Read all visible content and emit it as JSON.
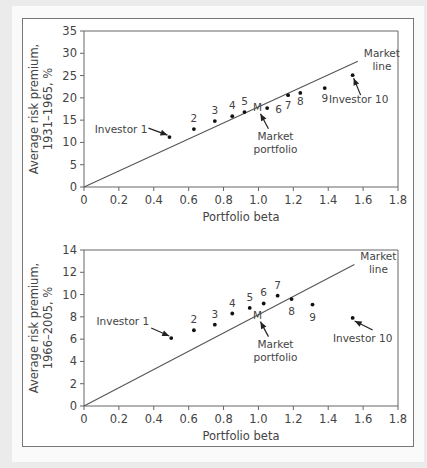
{
  "chart_data": [
    {
      "type": "scatter",
      "title": "",
      "xlabel": "Portfolio beta",
      "ylabel_lines": [
        "Average risk premium,",
        "1931–1965, %"
      ],
      "xlim": [
        0,
        1.8
      ],
      "ylim": [
        0,
        35
      ],
      "xticks": [
        0,
        0.2,
        0.4,
        0.6,
        0.8,
        1.0,
        1.2,
        1.4,
        1.6,
        1.8
      ],
      "xtick_labels": [
        "0",
        "0.2",
        "0.4",
        "0.6",
        "0.8",
        "1.0",
        "1.2",
        "1.4",
        "1.6",
        "1.8"
      ],
      "yticks": [
        0,
        5,
        10,
        15,
        20,
        25,
        30,
        35
      ],
      "ytick_labels": [
        "0",
        "5",
        "10",
        "15",
        "20",
        "25",
        "30",
        "35"
      ],
      "grid": false,
      "market_line": {
        "label_lines": [
          "Market",
          "line"
        ],
        "x": [
          0,
          1.57
        ],
        "y": [
          0,
          28.2
        ]
      },
      "market_portfolio": {
        "label": "M",
        "annotation_lines": [
          "Market",
          "portfolio"
        ],
        "x": 1.0,
        "y": 18.0
      },
      "points": [
        {
          "label": "Investor 1",
          "x": 0.49,
          "y": 11.2
        },
        {
          "label": "2",
          "x": 0.63,
          "y": 13.0
        },
        {
          "label": "3",
          "x": 0.75,
          "y": 14.8
        },
        {
          "label": "4",
          "x": 0.85,
          "y": 15.9
        },
        {
          "label": "5",
          "x": 0.92,
          "y": 16.8
        },
        {
          "label": "6",
          "x": 1.05,
          "y": 17.7
        },
        {
          "label": "7",
          "x": 1.17,
          "y": 20.6
        },
        {
          "label": "8",
          "x": 1.24,
          "y": 21.1
        },
        {
          "label": "9",
          "x": 1.38,
          "y": 22.2
        },
        {
          "label": "Investor 10",
          "x": 1.54,
          "y": 25.1
        }
      ]
    },
    {
      "type": "scatter",
      "title": "",
      "xlabel": "Portfolio beta",
      "ylabel_lines": [
        "Average risk premium,",
        "1966–2005, %"
      ],
      "xlim": [
        0,
        1.8
      ],
      "ylim": [
        0,
        14
      ],
      "xticks": [
        0,
        0.2,
        0.4,
        0.6,
        0.8,
        1.0,
        1.2,
        1.4,
        1.6,
        1.8
      ],
      "xtick_labels": [
        "0",
        "0.2",
        "0.4",
        "0.6",
        "0.8",
        "1.0",
        "1.2",
        "1.4",
        "1.6",
        "1.8"
      ],
      "yticks": [
        0,
        2,
        4,
        6,
        8,
        10,
        12,
        14
      ],
      "ytick_labels": [
        "0",
        "2",
        "4",
        "6",
        "8",
        "10",
        "12",
        "14"
      ],
      "grid": false,
      "market_line": {
        "label_lines": [
          "Market",
          "line"
        ],
        "x": [
          0,
          1.55
        ],
        "y": [
          0,
          12.7
        ]
      },
      "market_portfolio": {
        "label": "M",
        "annotation_lines": [
          "Market",
          "portfolio"
        ],
        "x": 1.0,
        "y": 8.2
      },
      "points": [
        {
          "label": "Investor 1",
          "x": 0.5,
          "y": 6.1
        },
        {
          "label": "2",
          "x": 0.63,
          "y": 6.8
        },
        {
          "label": "3",
          "x": 0.75,
          "y": 7.3
        },
        {
          "label": "4",
          "x": 0.85,
          "y": 8.3
        },
        {
          "label": "5",
          "x": 0.95,
          "y": 8.8
        },
        {
          "label": "6",
          "x": 1.03,
          "y": 9.2
        },
        {
          "label": "7",
          "x": 1.11,
          "y": 9.9
        },
        {
          "label": "8",
          "x": 1.19,
          "y": 9.6
        },
        {
          "label": "9",
          "x": 1.31,
          "y": 9.1
        },
        {
          "label": "Investor 10",
          "x": 1.54,
          "y": 7.9
        }
      ]
    }
  ]
}
